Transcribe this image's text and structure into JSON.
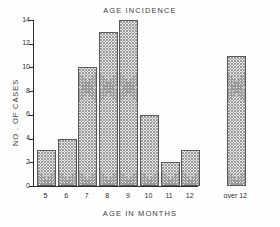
{
  "chart_data": {
    "type": "bar",
    "title": "AGE INCIDENCE",
    "xlabel": "AGE IN MONTHS",
    "ylabel": "NO . OF CASES",
    "categories": [
      "5",
      "6",
      "7",
      "8",
      "9",
      "10",
      "11",
      "12",
      "over 12"
    ],
    "values": [
      3,
      4,
      10,
      13,
      14,
      6,
      2,
      3,
      11
    ],
    "ylim": [
      0,
      14
    ],
    "yticks": [
      0,
      2,
      4,
      6,
      8,
      10,
      12,
      14
    ],
    "ytick_labels": [
      "0",
      "2",
      "4",
      "6",
      "8",
      "10",
      "12",
      "14"
    ],
    "grid": false,
    "legend": false,
    "bar_color": "#e9e9e9",
    "bar_edge_color": "#5a5a5a",
    "axis_color": "#2b2b2b"
  }
}
